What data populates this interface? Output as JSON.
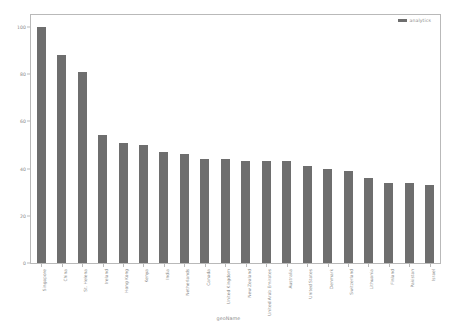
{
  "chart_data": {
    "type": "bar",
    "title": "",
    "xlabel": "geoName",
    "ylabel": "",
    "ylim": [
      0,
      105
    ],
    "yticks": [
      0,
      20,
      40,
      60,
      80,
      100
    ],
    "grid": false,
    "legend": {
      "position": "top-right",
      "entries": [
        {
          "name": "analytics",
          "color": "#6e6e6e"
        }
      ]
    },
    "series": [
      {
        "name": "analytics",
        "color": "#6e6e6e",
        "values": [
          100,
          88,
          81,
          54,
          51,
          50,
          47,
          46,
          44,
          44,
          43,
          43,
          43,
          41,
          40,
          39,
          36,
          34,
          34,
          33
        ]
      }
    ],
    "categories": [
      "Singapore",
      "China",
      "St. Helena",
      "Ireland",
      "Hong Kong",
      "Kenya",
      "India",
      "Netherlands",
      "Canada",
      "United Kingdom",
      "New Zealand",
      "United Arab Emirates",
      "Australia",
      "United States",
      "Denmark",
      "Switzerland",
      "Lithuania",
      "Finland",
      "Pakistan",
      "Israel"
    ]
  },
  "axis_colors": {
    "frame": "#b9b9b9",
    "tick_text": "#8a8a8a",
    "bar": "#6e6e6e"
  }
}
